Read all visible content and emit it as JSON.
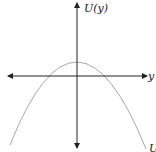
{
  "diagram": {
    "type": "function-graph",
    "y_axis_label": "U(y)",
    "x_axis_label": "y",
    "curve_label": "U",
    "curve": "downward parabola with vertex above origin",
    "colors": {
      "axes": "#222222",
      "curve": "#a8a8a8",
      "background": "#ffffff"
    }
  }
}
